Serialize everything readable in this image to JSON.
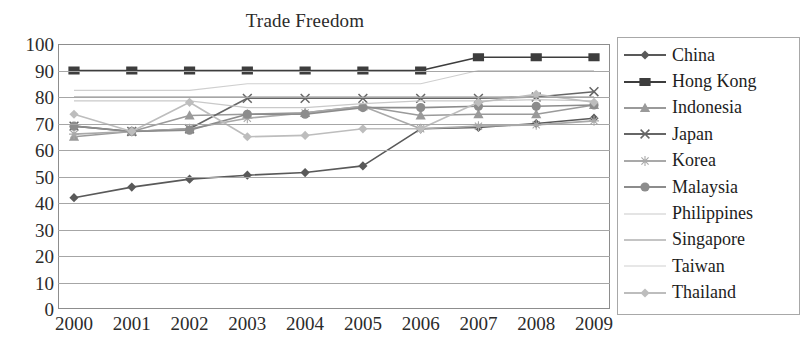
{
  "chart_data": {
    "type": "line",
    "title": "Trade Freedom",
    "xlabel": "",
    "ylabel": "",
    "grid": true,
    "legend_position": "right",
    "ylim": [
      0,
      100
    ],
    "yticks": [
      100,
      90,
      80,
      70,
      60,
      50,
      40,
      30,
      20,
      10,
      0
    ],
    "categories": [
      "2000",
      "2001",
      "2002",
      "2003",
      "2004",
      "2005",
      "2006",
      "2007",
      "2008",
      "2009"
    ],
    "x": [
      "2000",
      "2001",
      "2002",
      "2003",
      "2004",
      "2005",
      "2006",
      "2007",
      "2008",
      "2009"
    ],
    "series": [
      {
        "name": "China",
        "marker": "diamond",
        "color": "#595959",
        "values": [
          42,
          46,
          49,
          50.5,
          51.5,
          54,
          68,
          68.5,
          70,
          72
        ]
      },
      {
        "name": "Hong Kong",
        "marker": "square",
        "color": "#3d3d3d",
        "values": [
          90,
          90,
          90,
          90,
          90,
          90,
          90,
          95,
          95,
          95
        ]
      },
      {
        "name": "Indonesia",
        "marker": "triangle",
        "color": "#9a9a9a",
        "values": [
          65,
          67,
          73,
          73.5,
          74,
          76.5,
          73,
          73.5,
          73.5,
          77
        ]
      },
      {
        "name": "Japan",
        "marker": "x",
        "color": "#666666",
        "values": [
          69,
          67,
          68,
          79.5,
          79.5,
          79.5,
          79.5,
          79.5,
          80,
          82
        ]
      },
      {
        "name": "Korea",
        "marker": "star",
        "color": "#a9a9a9",
        "values": [
          66,
          67,
          68,
          72,
          74,
          76.5,
          68,
          69,
          69.5,
          71
        ]
      },
      {
        "name": "Malaysia",
        "marker": "circle",
        "color": "#8c8c8c",
        "values": [
          69,
          67,
          67.5,
          73.5,
          73.5,
          76,
          76,
          76.5,
          76.5,
          77
        ]
      },
      {
        "name": "Philippines",
        "marker": "none",
        "color": "#c9c9c9",
        "values": [
          78.5,
          78.5,
          78.5,
          76,
          76,
          77.5,
          78.5,
          78.5,
          79,
          78.5
        ]
      },
      {
        "name": "Singapore",
        "marker": "none",
        "color": "#8a8a8a",
        "values": [
          80,
          80,
          80,
          80,
          80,
          80,
          80,
          80,
          80,
          80
        ]
      },
      {
        "name": "Taiwan",
        "marker": "none",
        "color": "#cfcfcf",
        "values": [
          82.5,
          82.5,
          82.5,
          85,
          85,
          85,
          85,
          90,
          90,
          90
        ]
      },
      {
        "name": "Thailand",
        "marker": "diamond-light",
        "color": "#bdbdbd",
        "values": [
          73.5,
          67,
          78,
          65,
          65.5,
          68,
          68,
          78,
          81,
          78
        ]
      }
    ]
  },
  "legend": {
    "items": [
      {
        "label": "China"
      },
      {
        "label": "Hong Kong"
      },
      {
        "label": "Indonesia"
      },
      {
        "label": "Japan"
      },
      {
        "label": "Korea"
      },
      {
        "label": "Malaysia"
      },
      {
        "label": "Philippines"
      },
      {
        "label": "Singapore"
      },
      {
        "label": "Taiwan"
      },
      {
        "label": "Thailand"
      }
    ]
  }
}
